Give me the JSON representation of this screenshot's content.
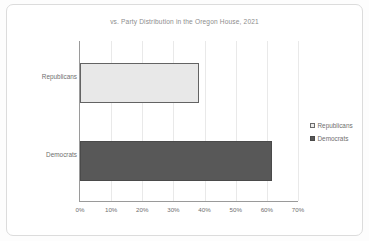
{
  "chart_data": {
    "type": "bar",
    "orientation": "horizontal",
    "title": "vs. Party Distribution  in the Oregon House, 2021",
    "xlabel": "",
    "ylabel": "",
    "categories": [
      "Republicans",
      "Democrats"
    ],
    "values": [
      38.3,
      61.7
    ],
    "value_suffix": "%",
    "xlim": [
      0,
      70
    ],
    "xticks": [
      0,
      10,
      20,
      30,
      40,
      50,
      60,
      70
    ],
    "xtick_labels": [
      "0%",
      "10%",
      "20%",
      "30%",
      "40%",
      "50%",
      "60%",
      "70%"
    ],
    "grid": "vertical",
    "legend_position": "right",
    "series": [
      {
        "name": "Republicans",
        "value": 38.3,
        "color": "#e8e8e8",
        "border_color": "#636363"
      },
      {
        "name": "Democrats",
        "value": 61.7,
        "color": "#585858",
        "border_color": "#4a4a4a"
      }
    ],
    "legend": [
      {
        "label": "Republicans",
        "swatch": "#e8e8e8"
      },
      {
        "label": "Democrats",
        "swatch": "#585858"
      }
    ]
  },
  "colors": {
    "card_border": "#dcdcdc",
    "axis": "#9a9a9a",
    "gridline": "#e9e9e9",
    "text": "#6f6f6f",
    "title_text": "#8d8d8d",
    "republicans": "#e8e8e8",
    "democrats": "#585858"
  }
}
